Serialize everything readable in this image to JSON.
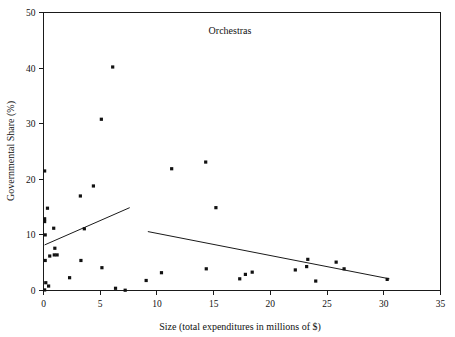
{
  "chart_data": {
    "type": "scatter",
    "title": "Orchestras",
    "xlabel": "Size (total expenditures in millions of $)",
    "ylabel": "Governmental Share (%)",
    "xlim": [
      0,
      35
    ],
    "ylim": [
      0,
      50
    ],
    "xticks": [
      0,
      5,
      10,
      15,
      20,
      25,
      30,
      35
    ],
    "yticks": [
      0,
      10,
      20,
      30,
      40,
      50
    ],
    "xtick_labels": [
      "0",
      "5",
      "10",
      "15",
      "20",
      "25",
      "30",
      "35"
    ],
    "ytick_labels": [
      "0",
      "10",
      "20",
      "30",
      "40",
      "50"
    ],
    "grid": false,
    "legend": "none",
    "marker": "square",
    "marker_color": "#111111",
    "axis_color": "#1a1a1a",
    "background_color": "#ffffff",
    "points": [
      {
        "x": 0.1,
        "y": 21.5
      },
      {
        "x": 0.35,
        "y": 14.8
      },
      {
        "x": 0.1,
        "y": 12.9
      },
      {
        "x": 0.1,
        "y": 12.4
      },
      {
        "x": 0.9,
        "y": 11.2
      },
      {
        "x": 0.15,
        "y": 10.0
      },
      {
        "x": 1.0,
        "y": 7.6
      },
      {
        "x": 0.15,
        "y": 5.4
      },
      {
        "x": 0.55,
        "y": 6.2
      },
      {
        "x": 0.95,
        "y": 6.4
      },
      {
        "x": 1.2,
        "y": 6.4
      },
      {
        "x": 0.2,
        "y": 1.4
      },
      {
        "x": 0.45,
        "y": 0.8
      },
      {
        "x": 0.1,
        "y": 0.1
      },
      {
        "x": 2.3,
        "y": 2.3
      },
      {
        "x": 3.25,
        "y": 17.0
      },
      {
        "x": 3.3,
        "y": 5.4
      },
      {
        "x": 3.6,
        "y": 11.1
      },
      {
        "x": 4.4,
        "y": 18.8
      },
      {
        "x": 5.1,
        "y": 30.8
      },
      {
        "x": 5.15,
        "y": 4.1
      },
      {
        "x": 6.1,
        "y": 40.2
      },
      {
        "x": 6.35,
        "y": 0.4
      },
      {
        "x": 7.2,
        "y": 0.05
      },
      {
        "x": 9.05,
        "y": 1.8
      },
      {
        "x": 10.4,
        "y": 3.2
      },
      {
        "x": 11.3,
        "y": 21.9
      },
      {
        "x": 14.3,
        "y": 23.1
      },
      {
        "x": 14.35,
        "y": 3.9
      },
      {
        "x": 15.2,
        "y": 14.9
      },
      {
        "x": 17.3,
        "y": 2.1
      },
      {
        "x": 17.8,
        "y": 2.9
      },
      {
        "x": 18.4,
        "y": 3.3
      },
      {
        "x": 22.2,
        "y": 3.7
      },
      {
        "x": 23.2,
        "y": 4.3
      },
      {
        "x": 23.3,
        "y": 5.6
      },
      {
        "x": 24.0,
        "y": 1.7
      },
      {
        "x": 25.8,
        "y": 5.1
      },
      {
        "x": 26.5,
        "y": 3.9
      },
      {
        "x": 30.3,
        "y": 2.0
      }
    ],
    "trend_lines": [
      {
        "name": "small-orchestras-fit",
        "x1": 0.1,
        "y1": 8.2,
        "x2": 7.6,
        "y2": 14.9
      },
      {
        "name": "large-orchestras-fit",
        "x1": 9.2,
        "y1": 10.6,
        "x2": 30.5,
        "y2": 2.1
      }
    ]
  }
}
